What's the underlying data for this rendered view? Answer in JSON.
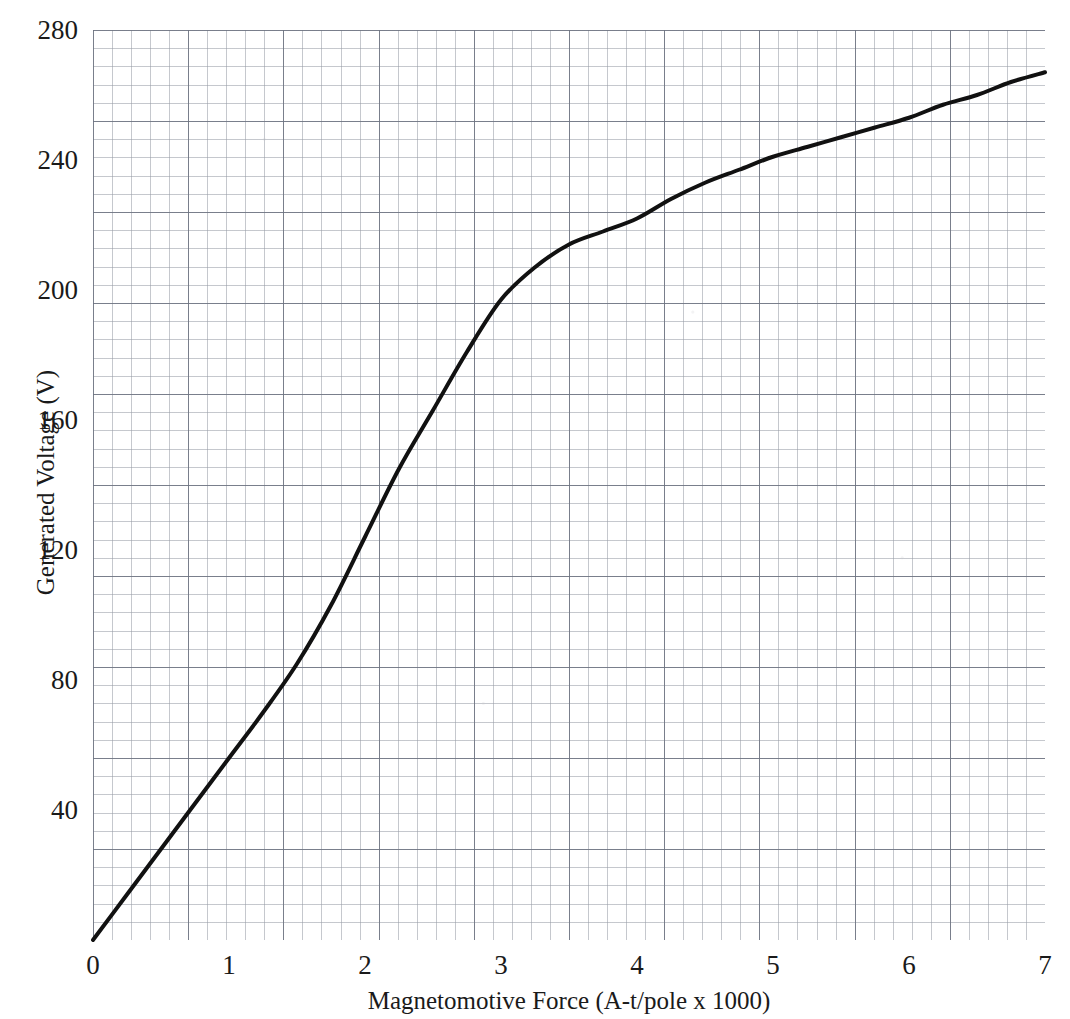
{
  "chart_data": {
    "type": "line",
    "title": "",
    "subtitle": "",
    "xlabel": "Magnetomotive Force (A-t/pole x 1000)",
    "ylabel": "Generated Voltage (V)",
    "xlim": [
      0,
      7
    ],
    "ylim": [
      0,
      280
    ],
    "xticks": [
      "0",
      "1",
      "2",
      "3",
      "4",
      "5",
      "6",
      "7"
    ],
    "xtick_values": [
      0,
      1,
      2,
      3,
      4,
      5,
      6,
      7
    ],
    "yticks": [
      "40",
      "80",
      "120",
      "160",
      "200",
      "240",
      "280"
    ],
    "ytick_values": [
      40,
      80,
      120,
      160,
      200,
      240,
      280
    ],
    "grid": "graph-paper: minor grid every 0.14 A-t/pole x1000 and 2.8 V; major grid every 0.7 A-t/pole x1000 and 28 V",
    "legend": "none",
    "series": [
      {
        "name": "Magnetization (saturation) curve",
        "color": "#111111",
        "line_width_px": 4,
        "x": [
          0.0,
          0.25,
          0.5,
          0.75,
          1.0,
          1.25,
          1.5,
          1.75,
          2.0,
          2.25,
          2.5,
          2.75,
          3.0,
          3.25,
          3.5,
          3.75,
          4.0,
          4.25,
          4.5,
          4.75,
          5.0,
          5.25,
          5.5,
          5.75,
          6.0,
          6.25,
          6.5,
          6.75,
          7.0
        ],
        "y": [
          0,
          14,
          28,
          42,
          56,
          70,
          85,
          103,
          124,
          145,
          163,
          181,
          197,
          207,
          214,
          218,
          222,
          228,
          233,
          237,
          241,
          244,
          247,
          250,
          253,
          257,
          260,
          264,
          267
        ]
      }
    ],
    "annotations": []
  },
  "axes": {
    "x_axis_label": "Magnetomotive Force (A-t/pole x 1000)",
    "y_axis_label": "Generated Voltage (V)"
  }
}
